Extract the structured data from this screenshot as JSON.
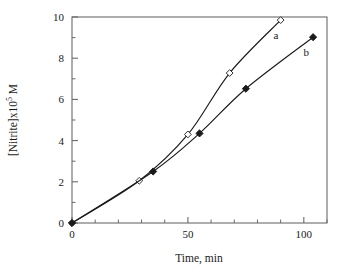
{
  "chart_data": {
    "type": "line",
    "title": "",
    "xlabel": "Time, min",
    "ylabel_prefix": "[Nitrite]x10",
    "ylabel_exponent": "5",
    "ylabel_suffix": " M",
    "ylabel_full": "[Nitrite]x10^5 M",
    "xlim": [
      0,
      110
    ],
    "ylim": [
      0,
      10
    ],
    "x_major_ticks": [
      0,
      50,
      100
    ],
    "x_major_tick_labels": [
      "0",
      "50",
      "100"
    ],
    "x_minor_tick_step": 10,
    "y_major_ticks": [
      0,
      2,
      4,
      6,
      8,
      10
    ],
    "y_major_tick_labels": [
      "0",
      "2",
      "4",
      "6",
      "8",
      "10"
    ],
    "y_minor_tick_step": 1,
    "grid": false,
    "legend_position": "inline-annotations",
    "frame": "box",
    "series": [
      {
        "name": "a",
        "label": "a",
        "marker": "open-diamond",
        "marker_fill": "#ffffff",
        "marker_stroke": "#1a1a1a",
        "line_color": "#1a1a1a",
        "annotation": "a",
        "annotation_x": 88,
        "annotation_y": 9.15,
        "x": [
          0,
          29,
          50,
          68,
          90
        ],
        "y": [
          0,
          2.05,
          4.3,
          7.28,
          9.85
        ]
      },
      {
        "name": "b",
        "label": "b",
        "marker": "filled-diamond",
        "marker_fill": "#1a1a1a",
        "marker_stroke": "#1a1a1a",
        "line_color": "#1a1a1a",
        "annotation": "b",
        "annotation_x": 101,
        "annotation_y": 8.3,
        "x": [
          0,
          35,
          55,
          75,
          104
        ],
        "y": [
          0,
          2.5,
          4.35,
          6.52,
          9.02
        ]
      }
    ],
    "colors": {
      "axis": "#6a6a6a",
      "text": "#1a1a1a",
      "line": "#1a1a1a",
      "background": "#ffffff"
    }
  }
}
